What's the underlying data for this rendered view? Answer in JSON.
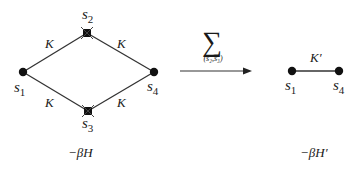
{
  "diagram": {
    "left_graph": {
      "nodes": [
        {
          "id": "s1",
          "label": "s",
          "sub": "1",
          "type": "kept",
          "x": 23,
          "y": 72
        },
        {
          "id": "s2",
          "label": "s",
          "sub": "2",
          "type": "decimated",
          "x": 87,
          "y": 33
        },
        {
          "id": "s3",
          "label": "s",
          "sub": "3",
          "type": "decimated",
          "x": 88,
          "y": 111
        },
        {
          "id": "s4",
          "label": "s",
          "sub": "4",
          "type": "kept",
          "x": 154,
          "y": 72
        }
      ],
      "edges": [
        {
          "from": "s1",
          "to": "s2",
          "label": "K"
        },
        {
          "from": "s2",
          "to": "s4",
          "label": "K"
        },
        {
          "from": "s1",
          "to": "s3",
          "label": "K"
        },
        {
          "from": "s3",
          "to": "s4",
          "label": "K"
        }
      ],
      "caption": "−βH"
    },
    "operation": {
      "symbol": "∑",
      "subscript": "(s₂,s₃)",
      "arrow": "right-arrow"
    },
    "right_graph": {
      "nodes": [
        {
          "id": "s1",
          "label": "s",
          "sub": "1",
          "type": "kept",
          "x": 292,
          "y": 71
        },
        {
          "id": "s4",
          "label": "s",
          "sub": "4",
          "type": "kept",
          "x": 339,
          "y": 71
        }
      ],
      "edges": [
        {
          "from": "s1",
          "to": "s4",
          "label": "K′"
        }
      ],
      "caption": "−βH′"
    }
  }
}
